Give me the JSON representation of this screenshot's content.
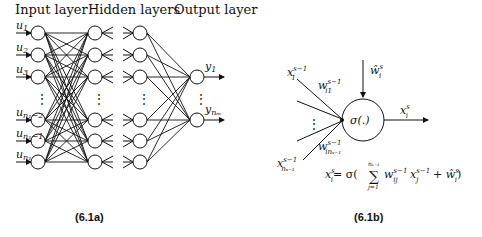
{
  "figure_a": {
    "headers": {
      "input": "Input layer",
      "hidden": "Hidden layers",
      "output": "Output layer"
    },
    "inputs": [
      {
        "base": "u",
        "sub": "1"
      },
      {
        "base": "u",
        "sub": "2"
      },
      {
        "base": "u",
        "sub": "3"
      },
      {
        "base": "u",
        "sub": "n₁−2"
      },
      {
        "base": "u",
        "sub": "n₁−1"
      },
      {
        "base": "u",
        "sub": "n₁"
      }
    ],
    "outputs": [
      {
        "base": "y",
        "sub": "1"
      },
      {
        "base": "y",
        "sub": "nₘ"
      }
    ],
    "ellipsis": "⋮",
    "caption": "(6.1a)"
  },
  "figure_b": {
    "inputs": {
      "first": {
        "base": "x",
        "sub": "1",
        "sup": "s−1"
      },
      "last": {
        "base": "x",
        "sub": "nₛ₋₁",
        "sup": "s−1"
      }
    },
    "weights": {
      "first": {
        "base": "w",
        "sub": "i1",
        "sup": "s−1"
      },
      "last": {
        "base": "w",
        "sub": "inₛ₋₁",
        "sup": "s−1"
      }
    },
    "bias": {
      "base": "ŵ",
      "sub": "i",
      "sup": "s"
    },
    "node_label": "σ(.)",
    "output": {
      "base": "x",
      "sub": "i",
      "sup": "s"
    },
    "ellipsis": "⋮",
    "equation": {
      "lhs": "x",
      "lhs_sub": "i",
      "lhs_sup": "s",
      "rhs_prefix": "= σ(",
      "sum": "∑",
      "sum_upper": "nₛ₋₁",
      "sum_lower": "j=1",
      "term_w": "w",
      "term_w_sub": "ij",
      "term_w_sup": "s−1",
      "term_x": "x",
      "term_x_sub": "j",
      "term_x_sup": "s−1",
      "plus": " + ",
      "bias": "ŵ",
      "bias_sub": "i",
      "bias_sup": "s",
      "close": ")"
    },
    "caption": "(6.1b)"
  }
}
